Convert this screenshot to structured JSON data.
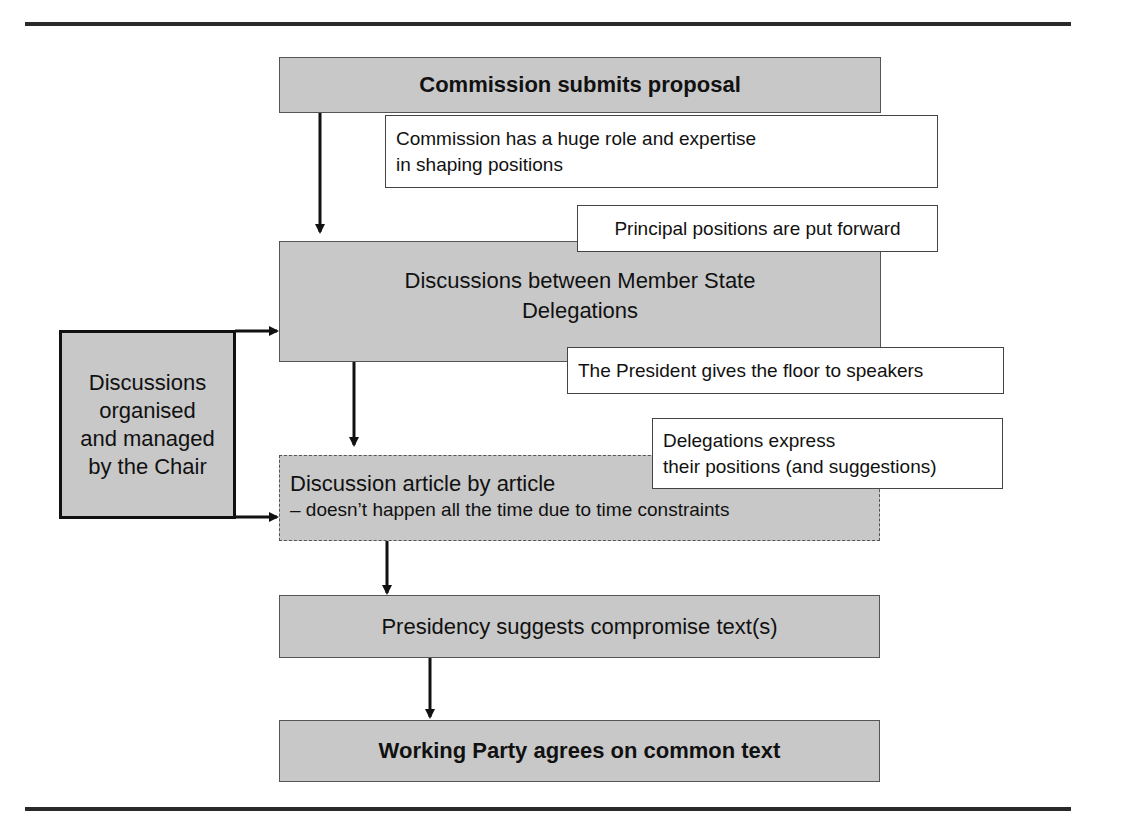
{
  "diagram": {
    "type": "flowchart",
    "steps": [
      {
        "id": "step1",
        "label": "Commission submits proposal"
      },
      {
        "id": "step2",
        "label_line1": "Discussions between Member State",
        "label_line2": "Delegations"
      },
      {
        "id": "step3",
        "label_line1": "Discussion article by article",
        "label_line2": "– doesn’t happen all the time due to time constraints"
      },
      {
        "id": "step4",
        "label": "Presidency suggests compromise text(s)"
      },
      {
        "id": "step5",
        "label": "Working Party agrees on common text"
      }
    ],
    "side_box": {
      "line1": "Discussions",
      "line2": "organised",
      "line3": "and managed",
      "line4": "by the Chair"
    },
    "callouts": [
      {
        "line1": "Commission has a huge role and expertise",
        "line2": "in shaping positions"
      },
      {
        "line1": "Principal positions are put forward"
      },
      {
        "line1": "The President gives the floor to speakers"
      },
      {
        "line1": "Delegations express",
        "line2": "their positions (and suggestions)"
      }
    ],
    "colors": {
      "box_fill": "#c8c8c8",
      "callout_fill": "#ffffff",
      "line": "#111111",
      "rule": "#2a2a2a"
    }
  }
}
